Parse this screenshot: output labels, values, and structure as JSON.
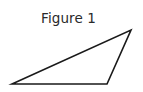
{
  "figure": {
    "caption": "Figure 1",
    "caption_color": "#2a2a2a",
    "background_color": "#ffffff"
  },
  "diagram": {
    "shape_name": "triangle",
    "stroke_color": "#1a1a1a",
    "stroke_width": 1.6,
    "fill": "none",
    "vertices": [
      {
        "label": "left-vertex",
        "x": 12,
        "y": 84
      },
      {
        "label": "apex-vertex",
        "x": 131,
        "y": 30
      },
      {
        "label": "bottom-right-vertex",
        "x": 107,
        "y": 84
      }
    ],
    "points_attr": "12,84 131,30 107,84"
  }
}
